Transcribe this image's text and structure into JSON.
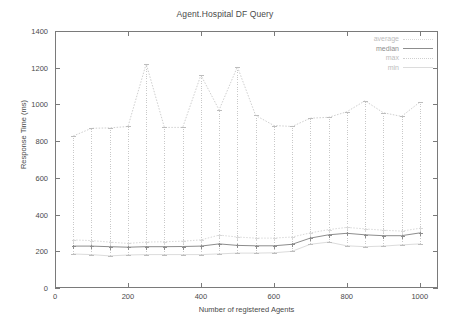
{
  "chart_data": {
    "type": "line",
    "title": "Agent.Hospital DF Query",
    "xlabel": "Number of registered Agents",
    "ylabel": "Response Time (ms)",
    "xlim": [
      0,
      1050
    ],
    "ylim": [
      0,
      1400
    ],
    "xticks": [
      0,
      200,
      400,
      600,
      800,
      1000
    ],
    "yticks": [
      0,
      200,
      400,
      600,
      800,
      1000,
      1200,
      1400
    ],
    "grid": false,
    "legend_position": "top-right",
    "x": [
      50,
      100,
      150,
      200,
      250,
      300,
      350,
      400,
      450,
      500,
      550,
      600,
      650,
      700,
      750,
      800,
      850,
      900,
      950,
      1000
    ],
    "series": [
      {
        "name": "average",
        "style": "dotted",
        "color": "#d8d8d8",
        "values": [
          262,
          258,
          250,
          243,
          250,
          252,
          255,
          262,
          288,
          278,
          272,
          272,
          278,
          300,
          318,
          330,
          322,
          315,
          310,
          325
        ]
      },
      {
        "name": "median",
        "style": "solid",
        "color": "#8d8d8d",
        "values": [
          228,
          228,
          225,
          222,
          225,
          225,
          226,
          228,
          240,
          232,
          230,
          230,
          238,
          272,
          290,
          298,
          290,
          285,
          285,
          300
        ]
      },
      {
        "name": "max",
        "style": "dotted",
        "color": "#cfcfcf",
        "values": [
          828,
          870,
          872,
          880,
          1222,
          875,
          875,
          1160,
          970,
          1205,
          940,
          885,
          880,
          925,
          930,
          960,
          1020,
          955,
          935,
          1012
        ]
      },
      {
        "name": "min",
        "style": "solid",
        "color": "#dcdcdc",
        "values": [
          185,
          182,
          175,
          180,
          182,
          182,
          182,
          182,
          186,
          190,
          190,
          192,
          200,
          238,
          250,
          230,
          225,
          228,
          235,
          240
        ]
      }
    ]
  },
  "legend": {
    "items": [
      {
        "label": "average"
      },
      {
        "label": "median"
      },
      {
        "label": "max"
      },
      {
        "label": "min"
      }
    ]
  },
  "axis": {
    "y_tick_labels": [
      "0",
      "200",
      "400",
      "600",
      "800",
      "1000",
      "1200",
      "1400"
    ],
    "x_tick_labels": [
      "0",
      "200",
      "400",
      "600",
      "800",
      "1000"
    ]
  }
}
